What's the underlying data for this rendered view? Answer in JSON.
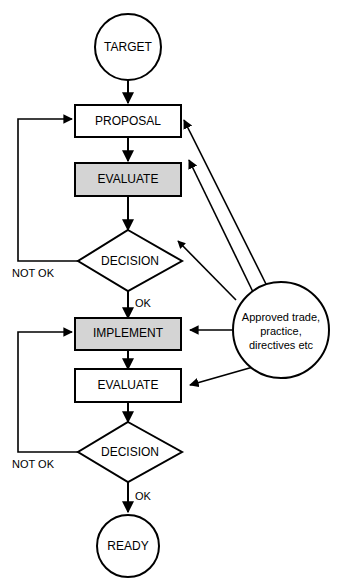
{
  "diagram": {
    "colors": {
      "stroke": "#000000",
      "background": "#ffffff",
      "shaded_fill": "#d4d4d4",
      "plain_fill": "#ffffff"
    },
    "nodes": {
      "target": {
        "label": "TARGET",
        "shape": "circle",
        "fill": "plain"
      },
      "proposal": {
        "label": "PROPOSAL",
        "shape": "rectangle",
        "fill": "plain"
      },
      "evaluate_upper": {
        "label": "EVALUATE",
        "shape": "rectangle",
        "fill": "shaded"
      },
      "decision_upper": {
        "label": "DECISION",
        "shape": "diamond",
        "fill": "plain"
      },
      "implement": {
        "label": "IMPLEMENT",
        "shape": "rectangle",
        "fill": "shaded"
      },
      "evaluate_lower": {
        "label": "EVALUATE",
        "shape": "rectangle",
        "fill": "plain"
      },
      "decision_lower": {
        "label": "DECISION",
        "shape": "diamond",
        "fill": "plain"
      },
      "ready": {
        "label": "READY",
        "shape": "circle",
        "fill": "plain"
      },
      "approved": {
        "shape": "circle",
        "fill": "plain",
        "line1": "Approved trade,",
        "line2": "practice,",
        "line3": "directives etc"
      }
    },
    "edge_labels": {
      "not_ok_upper": "NOT OK",
      "ok_upper": "OK",
      "not_ok_lower": "NOT OK",
      "ok_lower": "OK"
    }
  }
}
